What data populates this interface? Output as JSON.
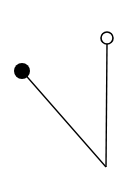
{
  "diagram": {
    "background": "#ffffff",
    "stroke_color": "#000000",
    "nodes": [
      {
        "id": "filled-node",
        "type": "filled-circle",
        "cx": 22,
        "cy": 71,
        "r": 8
      },
      {
        "id": "open-node",
        "type": "open-circle",
        "cx": 107,
        "cy": 38,
        "r": 6
      },
      {
        "id": "vertex",
        "type": "point",
        "cx": 106,
        "cy": 167
      }
    ],
    "edges": [
      {
        "from": "filled-node",
        "to": "vertex"
      },
      {
        "from": "open-node",
        "to": "vertex"
      }
    ]
  }
}
